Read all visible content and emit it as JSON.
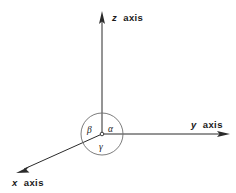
{
  "figure": {
    "background_color": "#ffffff",
    "line_color": "#2b2b2b",
    "circle_color": "#6d6d6d",
    "text_color": "#1a1a1a",
    "origin": {
      "x": 102,
      "y": 134,
      "label": "o"
    },
    "axes": [
      {
        "key": "z",
        "var": "z",
        "word": "axis",
        "label": "z axis",
        "direction": "up",
        "from": {
          "x": 102,
          "y": 134
        },
        "to": {
          "x": 102,
          "y": 14
        },
        "label_pos": {
          "x": 112,
          "y": 21
        }
      },
      {
        "key": "y",
        "var": "y",
        "word": "axis",
        "label": "y axis",
        "direction": "right",
        "from": {
          "x": 102,
          "y": 134
        },
        "to": {
          "x": 228,
          "y": 134
        },
        "label_pos": {
          "x": 191,
          "y": 128
        }
      },
      {
        "key": "x",
        "var": "x",
        "word": "axis",
        "label": "x axis",
        "direction": "down-left",
        "from": {
          "x": 102,
          "y": 134
        },
        "to": {
          "x": 18,
          "y": 172
        },
        "label_pos": {
          "x": 12,
          "y": 186
        }
      }
    ],
    "angle_circle": {
      "center": {
        "x": 102,
        "y": 134
      },
      "radius": 21
    },
    "angles": [
      {
        "key": "alpha",
        "symbol": "α",
        "pos": {
          "x": 108,
          "y": 129
        },
        "between": "z axis and y axis"
      },
      {
        "key": "beta",
        "symbol": "β",
        "pos": {
          "x": 88,
          "y": 130
        },
        "between": "z axis and x axis"
      },
      {
        "key": "gamma",
        "symbol": "γ",
        "pos": {
          "x": 100,
          "y": 148
        },
        "between": "x axis and y axis"
      }
    ]
  }
}
